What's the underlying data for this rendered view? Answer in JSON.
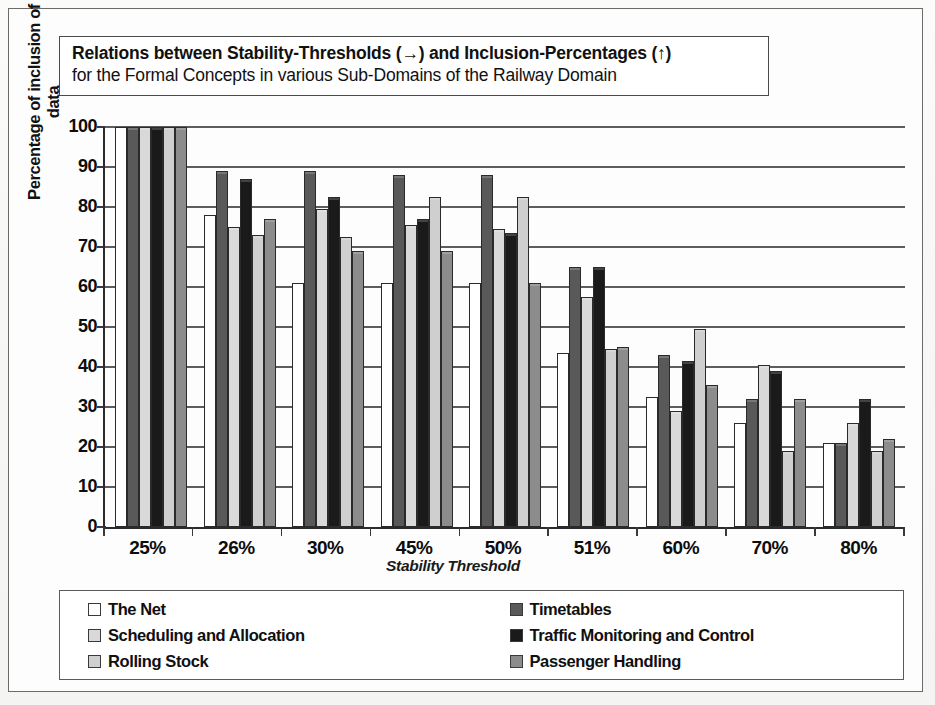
{
  "title": {
    "line1_prefix": "Relations between Stability-Thresholds (",
    "line1_arrow1": "→",
    "line1_mid": ") and Inclusion-Percentages (",
    "line1_arrow2": "↑",
    "line1_suffix": ")",
    "line2": "for the Formal Concepts in various Sub-Domains of the Railway Domain"
  },
  "colors": {
    "the_net": "#ffffff",
    "timetables": "#595959",
    "scheduling_and_allocation": "#d9d9d9",
    "traffic_monitoring_and_control": "#1a1a1a",
    "rolling_stock": "#cfcfcf",
    "passenger_handling": "#8c8c8c",
    "axis": "#2b2b2b",
    "grid": "#5d5d5d",
    "frame": "#6b6b6b"
  },
  "legend": {
    "left": [
      {
        "label": "The Net",
        "swatch": "#ffffff"
      },
      {
        "label": "Scheduling and Allocation",
        "swatch": "#d9d9d9"
      },
      {
        "label": "Rolling Stock",
        "swatch": "#cfcfcf"
      }
    ],
    "right": [
      {
        "label": "Timetables",
        "swatch": "#595959"
      },
      {
        "label": "Traffic Monitoring and Control",
        "swatch": "#1a1a1a"
      },
      {
        "label": "Passenger Handling",
        "swatch": "#8c8c8c"
      }
    ]
  },
  "chart_data": {
    "type": "bar",
    "title": "Relations between Stability-Thresholds (→) and Inclusion-Percentages (↑) for the Formal Concepts in various Sub-Domains of the Railway Domain",
    "xlabel": "Stability Threshold",
    "ylabel": "Percentage of inclusion of data",
    "ylim": [
      0,
      100
    ],
    "yticks": [
      0,
      10,
      20,
      30,
      40,
      50,
      60,
      70,
      80,
      90,
      100
    ],
    "grid": true,
    "legend_position": "bottom",
    "categories": [
      "25%",
      "26%",
      "30%",
      "45%",
      "50%",
      "51%",
      "60%",
      "70%",
      "80%"
    ],
    "series": [
      {
        "name": "The Net",
        "color": "#ffffff",
        "values": [
          100,
          78,
          61,
          61,
          61,
          43.5,
          32.5,
          26,
          21
        ]
      },
      {
        "name": "Timetables",
        "color": "#595959",
        "values": [
          100,
          89,
          89,
          88,
          88,
          65,
          43,
          32,
          21
        ]
      },
      {
        "name": "Scheduling and Allocation",
        "color": "#d9d9d9",
        "values": [
          100,
          75,
          79.5,
          75.5,
          74.5,
          57.5,
          29,
          40.5,
          26
        ]
      },
      {
        "name": "Traffic Monitoring and Control",
        "color": "#1a1a1a",
        "values": [
          100,
          87,
          82.5,
          77,
          73.5,
          65,
          41.5,
          39,
          32
        ]
      },
      {
        "name": "Rolling Stock",
        "color": "#cfcfcf",
        "values": [
          100,
          73,
          72.5,
          82.5,
          82.5,
          44.5,
          49.5,
          19,
          19
        ]
      },
      {
        "name": "Passenger Handling",
        "color": "#8c8c8c",
        "values": [
          100,
          77,
          69,
          69,
          61,
          45,
          35.5,
          32,
          22
        ]
      }
    ]
  }
}
